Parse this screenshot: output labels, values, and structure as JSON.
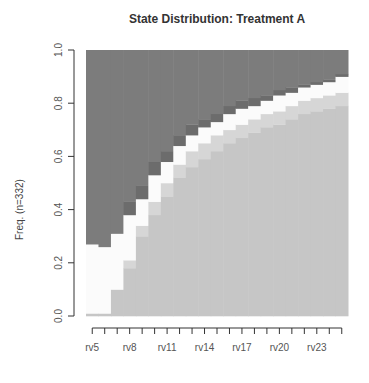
{
  "chart_data": {
    "type": "area",
    "subtype": "stacked-state-distribution",
    "title": "State Distribution: Treatment A",
    "xlabel": "",
    "ylabel": "Freq. (n=332)",
    "ylim": [
      0,
      1
    ],
    "yticks": [
      "0.0",
      "0.2",
      "0.4",
      "0.6",
      "0.8",
      "1.0"
    ],
    "categories": [
      "rv5",
      "rv6",
      "rv7",
      "rv8",
      "rv9",
      "rv10",
      "rv11",
      "rv12",
      "rv13",
      "rv14",
      "rv15",
      "rv16",
      "rv17",
      "rv18",
      "rv19",
      "rv20",
      "rv21",
      "rv22",
      "rv23",
      "rv24",
      "rv25"
    ],
    "xtick_labels_shown": [
      "rv5",
      "rv8",
      "rv11",
      "rv14",
      "rv17",
      "rv20",
      "rv23"
    ],
    "grid": false,
    "legend": null,
    "series": [
      {
        "name": "state1",
        "color": "#c6c6c6",
        "values": [
          0.01,
          0.01,
          0.1,
          0.18,
          0.3,
          0.38,
          0.45,
          0.52,
          0.56,
          0.59,
          0.62,
          0.65,
          0.67,
          0.69,
          0.71,
          0.72,
          0.74,
          0.76,
          0.77,
          0.78,
          0.79
        ]
      },
      {
        "name": "state2",
        "color": "#d6d6d6",
        "values": [
          0.0,
          0.0,
          0.0,
          0.03,
          0.04,
          0.05,
          0.05,
          0.05,
          0.06,
          0.06,
          0.06,
          0.05,
          0.05,
          0.05,
          0.05,
          0.05,
          0.05,
          0.05,
          0.05,
          0.05,
          0.05
        ]
      },
      {
        "name": "state3",
        "color": "#fbfbfb",
        "values": [
          0.26,
          0.25,
          0.21,
          0.17,
          0.1,
          0.1,
          0.08,
          0.07,
          0.06,
          0.06,
          0.05,
          0.06,
          0.06,
          0.05,
          0.05,
          0.06,
          0.05,
          0.05,
          0.05,
          0.05,
          0.06
        ]
      },
      {
        "name": "state4",
        "color": "#6c6c6c",
        "values": [
          0.0,
          0.0,
          0.0,
          0.05,
          0.05,
          0.05,
          0.04,
          0.04,
          0.04,
          0.03,
          0.03,
          0.03,
          0.03,
          0.03,
          0.02,
          0.02,
          0.02,
          0.01,
          0.01,
          0.01,
          0.01
        ]
      },
      {
        "name": "state5",
        "color": "#7c7c7c",
        "values": [
          0.73,
          0.74,
          0.69,
          0.57,
          0.51,
          0.42,
          0.38,
          0.32,
          0.28,
          0.26,
          0.24,
          0.21,
          0.19,
          0.18,
          0.17,
          0.15,
          0.14,
          0.13,
          0.12,
          0.11,
          0.09
        ]
      }
    ]
  }
}
